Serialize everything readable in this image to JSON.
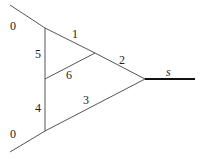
{
  "diagram": {
    "labels": {
      "top_zero": "0",
      "bottom_zero": "0",
      "e1": "1",
      "e2": "2",
      "e3": "3",
      "e4": "4",
      "e5": "5",
      "e6": "6",
      "s": "s"
    },
    "colors": {
      "line": "#555555",
      "thick": "#111111",
      "text": "#222222"
    }
  }
}
